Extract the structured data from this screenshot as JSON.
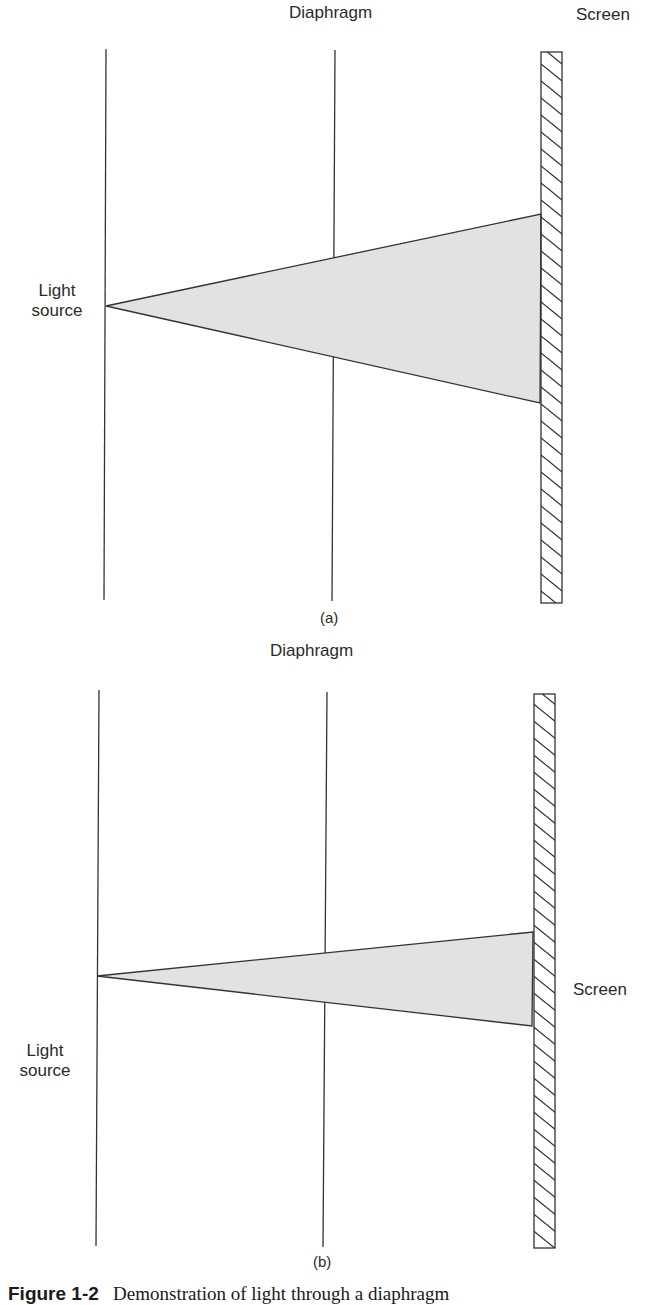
{
  "colors": {
    "line": "#333333",
    "beam_fill": "#e2e2e2",
    "screen_fill": "#ffffff",
    "text": "#2a2a2a"
  },
  "panels": [
    {
      "id": "a",
      "panel_label": "(a)",
      "labels": {
        "diaphragm": "Diaphragm",
        "screen": "Screen",
        "light_source_line1": "Light",
        "light_source_line2": "source"
      },
      "geometry": {
        "source_line": {
          "x1": 106,
          "y1": 49,
          "x2": 104,
          "y2": 600
        },
        "diaphragm_line": {
          "x1": 335,
          "y1": 50,
          "x2": 332,
          "y2": 601
        },
        "screen": {
          "x": 541,
          "y": 52,
          "width": 21,
          "height": 551
        },
        "beam": {
          "apex": [
            106,
            306
          ],
          "top": [
            541,
            214
          ],
          "bottom": [
            540,
            403
          ]
        }
      }
    },
    {
      "id": "b",
      "panel_label": "(b)",
      "labels": {
        "diaphragm": "Diaphragm",
        "screen": "Screen",
        "light_source_line1": "Light",
        "light_source_line2": "source"
      },
      "geometry": {
        "source_line": {
          "x1": 99,
          "y1": 690,
          "x2": 96,
          "y2": 1246
        },
        "diaphragm_line": {
          "x1": 327,
          "y1": 692,
          "x2": 323,
          "y2": 1247
        },
        "screen": {
          "x": 534,
          "y": 694,
          "width": 21,
          "height": 554
        },
        "beam": {
          "apex": [
            97,
            976
          ],
          "top": [
            533,
            932
          ],
          "bottom": [
            532,
            1026
          ]
        }
      }
    }
  ],
  "caption": {
    "figure_number": "Figure 1-2",
    "text": "Demonstration of light through a diaphragm"
  }
}
